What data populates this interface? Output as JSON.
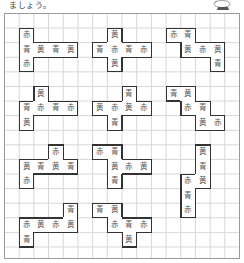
{
  "instruction_text": "ましょう。",
  "mascot_icon": "mascot-illustration",
  "grid": {
    "cols": 16,
    "rows": 17,
    "cell_w": 14.7,
    "cell_h": 14.6,
    "left": 4,
    "top": 13
  },
  "shapes": [
    {
      "id": 1,
      "cells": [
        [
          1,
          1,
          "赤"
        ],
        [
          1,
          2,
          "青"
        ],
        [
          2,
          2,
          "黄"
        ],
        [
          3,
          2,
          "青"
        ],
        [
          4,
          2,
          "黄"
        ],
        [
          1,
          3,
          "赤"
        ]
      ]
    },
    {
      "id": 2,
      "cells": [
        [
          7,
          1,
          "黄"
        ],
        [
          6,
          2,
          "青"
        ],
        [
          7,
          2,
          "赤"
        ],
        [
          8,
          2,
          "青"
        ],
        [
          9,
          2,
          "赤"
        ],
        [
          7,
          3,
          "黄"
        ]
      ]
    },
    {
      "id": 3,
      "cells": [
        [
          11,
          1,
          "赤"
        ],
        [
          12,
          1,
          "青"
        ],
        [
          12,
          2,
          "黄"
        ],
        [
          13,
          2,
          "赤"
        ],
        [
          14,
          2,
          "黄"
        ],
        [
          14,
          3,
          "青"
        ]
      ]
    },
    {
      "id": 4,
      "cells": [
        [
          2,
          5,
          "黄"
        ],
        [
          1,
          6,
          "青"
        ],
        [
          2,
          6,
          "赤"
        ],
        [
          3,
          6,
          "青"
        ],
        [
          4,
          6,
          "赤"
        ],
        [
          1,
          7,
          "黄"
        ]
      ]
    },
    {
      "id": 5,
      "cells": [
        [
          8,
          5,
          "青"
        ],
        [
          6,
          6,
          "黄"
        ],
        [
          7,
          6,
          "赤"
        ],
        [
          8,
          6,
          "黄"
        ],
        [
          9,
          6,
          "赤"
        ],
        [
          7,
          7,
          "青"
        ]
      ]
    },
    {
      "id": 6,
      "cells": [
        [
          11,
          5,
          "青"
        ],
        [
          12,
          5,
          "黄"
        ],
        [
          12,
          6,
          "赤"
        ],
        [
          13,
          6,
          "青"
        ],
        [
          13,
          7,
          "黄"
        ],
        [
          14,
          7,
          "赤"
        ]
      ]
    },
    {
      "id": 7,
      "cells": [
        [
          3,
          9,
          "赤"
        ],
        [
          1,
          10,
          "黄"
        ],
        [
          2,
          10,
          "青"
        ],
        [
          3,
          10,
          "黄"
        ],
        [
          4,
          10,
          "青"
        ],
        [
          1,
          11,
          "赤"
        ]
      ]
    },
    {
      "id": 8,
      "cells": [
        [
          6,
          9,
          "赤"
        ],
        [
          7,
          9,
          "青"
        ],
        [
          7,
          10,
          "黄"
        ],
        [
          8,
          10,
          "赤"
        ],
        [
          9,
          10,
          "黄"
        ],
        [
          7,
          11,
          "青"
        ]
      ]
    },
    {
      "id": 9,
      "cells": [
        [
          13,
          9,
          "黄"
        ],
        [
          13,
          10,
          "青"
        ],
        [
          12,
          11,
          "赤"
        ],
        [
          13,
          11,
          "黄"
        ],
        [
          12,
          12,
          "青"
        ],
        [
          12,
          13,
          "赤"
        ]
      ]
    },
    {
      "id": 10,
      "cells": [
        [
          4,
          13,
          "青"
        ],
        [
          1,
          14,
          "赤"
        ],
        [
          2,
          14,
          "黄"
        ],
        [
          3,
          14,
          "赤"
        ],
        [
          4,
          14,
          "黄"
        ],
        [
          1,
          15,
          "青"
        ]
      ]
    },
    {
      "id": 11,
      "cells": [
        [
          6,
          13,
          "青"
        ],
        [
          7,
          13,
          "黄"
        ],
        [
          7,
          14,
          "赤"
        ],
        [
          8,
          14,
          "青"
        ],
        [
          9,
          14,
          "赤"
        ],
        [
          8,
          15,
          "黄"
        ]
      ]
    }
  ]
}
